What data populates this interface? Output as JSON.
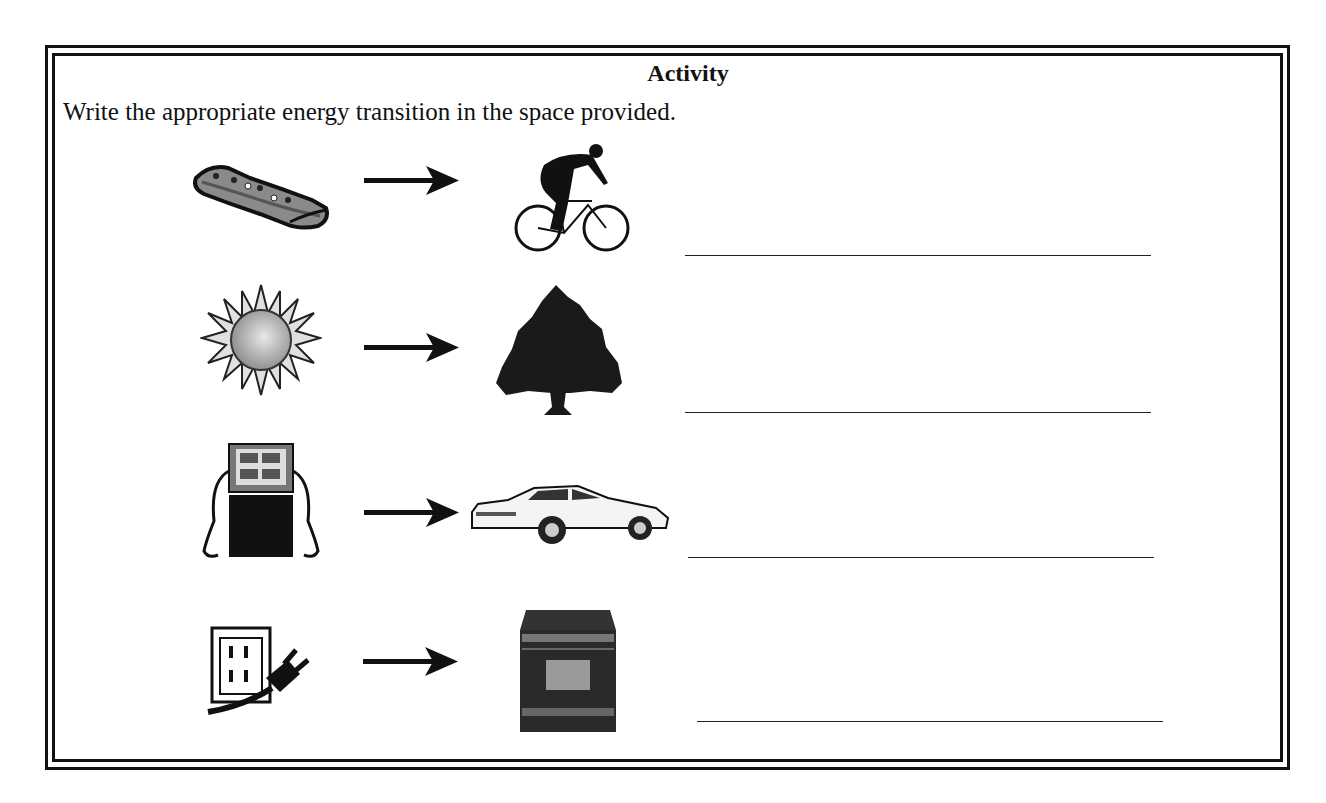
{
  "worksheet": {
    "title": "Activity",
    "instruction": "Write the appropriate energy transition in the space provided."
  },
  "rows": [
    {
      "source": "food-bar",
      "target": "cyclist",
      "answer": ""
    },
    {
      "source": "sun",
      "target": "tree",
      "answer": ""
    },
    {
      "source": "gas-pump",
      "target": "car",
      "answer": ""
    },
    {
      "source": "electrical-outlet",
      "target": "oven",
      "answer": ""
    }
  ]
}
